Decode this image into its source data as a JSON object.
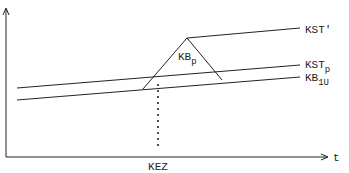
{
  "diagram": {
    "axes": {
      "x_label": "t",
      "x_tick_label": "KEZ"
    },
    "lines": [
      {
        "id": "kst-prime",
        "label_main": "KST",
        "label_suffix": "′"
      },
      {
        "id": "kst-p",
        "label_main": "KST",
        "label_sub": "p"
      },
      {
        "id": "kb-1u",
        "label_main": "KB",
        "label_sub": "1U"
      }
    ],
    "triangle": {
      "label_main": "KB",
      "label_sub": "p"
    },
    "colors": {
      "stroke": "#222222",
      "background": "#ffffff"
    }
  }
}
